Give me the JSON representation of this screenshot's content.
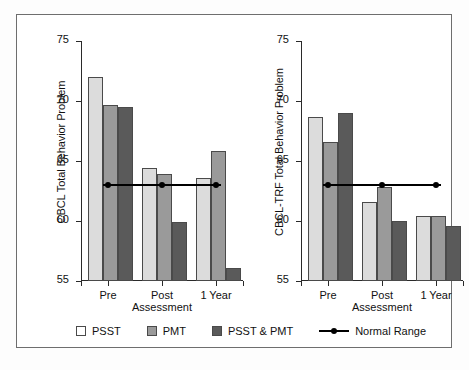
{
  "figure": {
    "background_color": "#ffffff",
    "frame_color": "#6e6e6e"
  },
  "legend": {
    "position": "bottom-center",
    "items": [
      {
        "label": "PSST",
        "color": "#dcdcdc",
        "marker": "square"
      },
      {
        "label": "PMT",
        "color": "#9a9a9a",
        "marker": "square"
      },
      {
        "label": "PSST & PMT",
        "color": "#5a5a5a",
        "marker": "square"
      },
      {
        "label": "Normal Range",
        "color": "#000000",
        "marker": "line-dot"
      }
    ]
  },
  "chart_data": [
    {
      "type": "bar",
      "title": "",
      "xlabel": "Assessment",
      "ylabel": "CBCL Total Behavior Problem",
      "categories": [
        "Pre",
        "Post",
        "1 Year"
      ],
      "ylim": [
        55,
        75
      ],
      "yticks": [
        55,
        60,
        65,
        70,
        75
      ],
      "grid": false,
      "legend_position": "bottom",
      "series": [
        {
          "name": "PSST",
          "color": "#dcdcdc",
          "values": [
            72.0,
            64.4,
            63.6
          ]
        },
        {
          "name": "PMT",
          "color": "#9a9a9a",
          "values": [
            69.7,
            63.9,
            65.8
          ]
        },
        {
          "name": "PSST & PMT",
          "color": "#5a5a5a",
          "values": [
            69.5,
            59.9,
            56.1
          ]
        }
      ],
      "reference_line": {
        "name": "Normal Range",
        "value": 63,
        "color": "#000000",
        "markers_at": [
          "Pre",
          "Post",
          "1 Year"
        ]
      }
    },
    {
      "type": "bar",
      "title": "",
      "xlabel": "Assessment",
      "ylabel": "CBCL-TRF Total Behavior Problem",
      "categories": [
        "Pre",
        "Post",
        "1 Year"
      ],
      "ylim": [
        55,
        75
      ],
      "yticks": [
        55,
        60,
        65,
        70,
        75
      ],
      "grid": false,
      "legend_position": "bottom",
      "series": [
        {
          "name": "PSST",
          "color": "#dcdcdc",
          "values": [
            68.7,
            61.6,
            60.4
          ]
        },
        {
          "name": "PMT",
          "color": "#9a9a9a",
          "values": [
            66.6,
            62.8,
            60.4
          ]
        },
        {
          "name": "PSST & PMT",
          "color": "#5a5a5a",
          "values": [
            69.0,
            60.0,
            59.6
          ]
        }
      ],
      "reference_line": {
        "name": "Normal Range",
        "value": 63,
        "color": "#000000",
        "markers_at": [
          "Pre",
          "Post",
          "1 Year"
        ]
      }
    }
  ]
}
